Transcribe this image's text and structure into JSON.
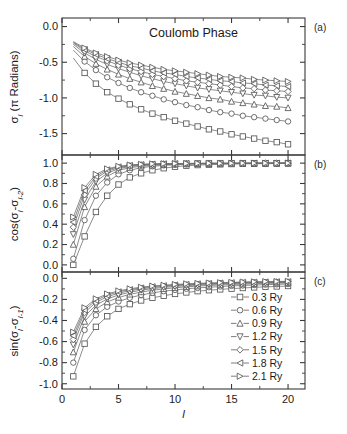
{
  "figure": {
    "annotation": "Coulomb Phase",
    "xlabel": "l",
    "panel_labels": [
      "(a)",
      "(b)",
      "(c)"
    ]
  },
  "legend": {
    "entries": [
      {
        "label": "0.3 Ry",
        "marker": "square"
      },
      {
        "label": "0.6 Ry",
        "marker": "circle"
      },
      {
        "label": "0.9 Ry",
        "marker": "triangle-up"
      },
      {
        "label": "1.2 Ry",
        "marker": "triangle-down"
      },
      {
        "label": "1.5 Ry",
        "marker": "diamond"
      },
      {
        "label": "1.8 Ry",
        "marker": "triangle-left"
      },
      {
        "label": "2.1 Ry",
        "marker": "triangle-right"
      }
    ]
  },
  "chart_data": [
    {
      "type": "line",
      "panel": "(a)",
      "title": "Coulomb Phase",
      "xlabel": "l",
      "ylabel": "σ_l (π Radians)",
      "ylabel_parts": {
        "sym": "σ",
        "sub": "l",
        "unit": "( π Radians)"
      },
      "xlim": [
        0,
        21.5
      ],
      "ylim": [
        -1.8,
        0.12
      ],
      "xticks": [
        0,
        5,
        10,
        15,
        20
      ],
      "yticks": [
        0.0,
        -0.5,
        -1.0,
        -1.5
      ],
      "ytick_labels": [
        "0.0",
        "-0.5",
        "-1.0",
        "-1.5"
      ],
      "grid": false,
      "legend_position": "none",
      "x": [
        1,
        2,
        3,
        4,
        5,
        6,
        7,
        8,
        9,
        10,
        11,
        12,
        13,
        14,
        15,
        16,
        17,
        18,
        19,
        20
      ],
      "series": [
        {
          "name": "0.3 Ry",
          "marker": "square",
          "values": [
            -0.44,
            -0.65,
            -0.8,
            -0.92,
            -1.01,
            -1.09,
            -1.16,
            -1.22,
            -1.27,
            -1.32,
            -1.36,
            -1.4,
            -1.44,
            -1.47,
            -1.51,
            -1.54,
            -1.57,
            -1.6,
            -1.62,
            -1.65
          ]
        },
        {
          "name": "0.6 Ry",
          "marker": "circle",
          "values": [
            -0.33,
            -0.49,
            -0.61,
            -0.71,
            -0.79,
            -0.86,
            -0.92,
            -0.97,
            -1.02,
            -1.06,
            -1.1,
            -1.13,
            -1.17,
            -1.2,
            -1.22,
            -1.25,
            -1.27,
            -1.29,
            -1.31,
            -1.33
          ]
        },
        {
          "name": "0.9 Ry",
          "marker": "triangle-up",
          "values": [
            -0.28,
            -0.42,
            -0.52,
            -0.6,
            -0.67,
            -0.73,
            -0.78,
            -0.83,
            -0.87,
            -0.91,
            -0.94,
            -0.97,
            -1.0,
            -1.02,
            -1.05,
            -1.07,
            -1.09,
            -1.11,
            -1.12,
            -1.14
          ]
        },
        {
          "name": "1.2 Ry",
          "marker": "triangle-down",
          "values": [
            -0.25,
            -0.37,
            -0.46,
            -0.53,
            -0.59,
            -0.64,
            -0.69,
            -0.73,
            -0.77,
            -0.8,
            -0.83,
            -0.86,
            -0.88,
            -0.9,
            -0.92,
            -0.94,
            -0.96,
            -0.97,
            -0.99,
            -1.0
          ]
        },
        {
          "name": "1.5 Ry",
          "marker": "diamond",
          "values": [
            -0.23,
            -0.34,
            -0.42,
            -0.48,
            -0.54,
            -0.59,
            -0.63,
            -0.67,
            -0.7,
            -0.73,
            -0.76,
            -0.78,
            -0.8,
            -0.82,
            -0.84,
            -0.86,
            -0.87,
            -0.89,
            -0.9,
            -0.91
          ]
        },
        {
          "name": "1.8 Ry",
          "marker": "triangle-left",
          "values": [
            -0.22,
            -0.32,
            -0.39,
            -0.45,
            -0.5,
            -0.55,
            -0.58,
            -0.62,
            -0.65,
            -0.67,
            -0.7,
            -0.72,
            -0.74,
            -0.76,
            -0.77,
            -0.79,
            -0.8,
            -0.82,
            -0.83,
            -0.84
          ]
        },
        {
          "name": "2.1 Ry",
          "marker": "triangle-right",
          "values": [
            -0.21,
            -0.3,
            -0.37,
            -0.42,
            -0.47,
            -0.51,
            -0.54,
            -0.57,
            -0.6,
            -0.62,
            -0.64,
            -0.66,
            -0.68,
            -0.7,
            -0.71,
            -0.72,
            -0.74,
            -0.75,
            -0.76,
            -0.77
          ]
        }
      ]
    },
    {
      "type": "line",
      "panel": "(b)",
      "xlabel": "l",
      "ylabel": "cos(σ_l-σ_l-2)",
      "xlim": [
        0,
        21.5
      ],
      "ylim": [
        -0.07,
        1.08
      ],
      "xticks": [
        0,
        5,
        10,
        15,
        20
      ],
      "yticks": [
        1.0,
        0.8,
        0.6,
        0.4,
        0.2,
        0.0
      ],
      "ytick_labels": [
        "1.0",
        "0.8",
        "0.6",
        "0.4",
        "0.2",
        "0.0"
      ],
      "grid": false,
      "legend_position": "none",
      "x": [
        1,
        2,
        3,
        4,
        5,
        6,
        7,
        8,
        9,
        10,
        11,
        12,
        13,
        14,
        15,
        16,
        17,
        18,
        19,
        20
      ],
      "series": [
        {
          "name": "0.3 Ry",
          "marker": "square",
          "values": [
            0.0,
            0.28,
            0.52,
            0.68,
            0.79,
            0.86,
            0.9,
            0.93,
            0.95,
            0.965,
            0.975,
            0.981,
            0.985,
            0.988,
            0.991,
            0.993,
            0.994,
            0.995,
            0.996,
            0.997
          ]
        },
        {
          "name": "0.6 Ry",
          "marker": "circle",
          "values": [
            0.06,
            0.44,
            0.68,
            0.81,
            0.89,
            0.93,
            0.955,
            0.969,
            0.978,
            0.984,
            0.988,
            0.991,
            0.993,
            0.995,
            0.996,
            0.997,
            0.997,
            0.998,
            0.998,
            0.999
          ]
        },
        {
          "name": "0.9 Ry",
          "marker": "triangle-up",
          "values": [
            0.2,
            0.57,
            0.77,
            0.87,
            0.93,
            0.955,
            0.97,
            0.979,
            0.985,
            0.989,
            0.992,
            0.994,
            0.995,
            0.996,
            0.997,
            0.998,
            0.998,
            0.999,
            0.999,
            0.999
          ]
        },
        {
          "name": "1.2 Ry",
          "marker": "triangle-down",
          "values": [
            0.3,
            0.64,
            0.82,
            0.9,
            0.945,
            0.967,
            0.978,
            0.985,
            0.989,
            0.992,
            0.994,
            0.996,
            0.997,
            0.997,
            0.998,
            0.998,
            0.999,
            0.999,
            0.999,
            1.0
          ]
        },
        {
          "name": "1.5 Ry",
          "marker": "diamond",
          "values": [
            0.37,
            0.69,
            0.85,
            0.92,
            0.955,
            0.974,
            0.983,
            0.988,
            0.992,
            0.994,
            0.996,
            0.997,
            0.998,
            0.998,
            0.999,
            0.999,
            0.999,
            1.0,
            1.0,
            1.0
          ]
        },
        {
          "name": "1.8 Ry",
          "marker": "triangle-left",
          "values": [
            0.42,
            0.73,
            0.87,
            0.934,
            0.963,
            0.978,
            0.986,
            0.991,
            0.994,
            0.995,
            0.997,
            0.997,
            0.998,
            0.999,
            0.999,
            0.999,
            1.0,
            1.0,
            1.0,
            1.0
          ]
        },
        {
          "name": "2.1 Ry",
          "marker": "triangle-right",
          "values": [
            0.47,
            0.76,
            0.89,
            0.944,
            0.969,
            0.982,
            0.989,
            0.993,
            0.995,
            0.996,
            0.997,
            0.998,
            0.999,
            0.999,
            0.999,
            1.0,
            1.0,
            1.0,
            1.0,
            1.0
          ]
        }
      ]
    },
    {
      "type": "line",
      "panel": "(c)",
      "xlabel": "l",
      "ylabel": "sin(σ_l-σ_l-1)",
      "xlim": [
        0,
        21.5
      ],
      "ylim": [
        -1.05,
        0.06
      ],
      "xticks": [
        0,
        5,
        10,
        15,
        20
      ],
      "yticks": [
        0.0,
        -0.2,
        -0.4,
        -0.6,
        -0.8,
        -1.0
      ],
      "ytick_labels": [
        "0.0",
        "-0.2",
        "-0.4",
        "-0.6",
        "-0.8",
        "-1.0"
      ],
      "grid": false,
      "legend_position": "bottom-right",
      "x": [
        1,
        2,
        3,
        4,
        5,
        6,
        7,
        8,
        9,
        10,
        11,
        12,
        13,
        14,
        15,
        16,
        17,
        18,
        19,
        20
      ],
      "series": [
        {
          "name": "0.3 Ry",
          "marker": "square",
          "values": [
            -0.93,
            -0.62,
            -0.46,
            -0.36,
            -0.29,
            -0.245,
            -0.21,
            -0.185,
            -0.165,
            -0.148,
            -0.134,
            -0.122,
            -0.113,
            -0.105,
            -0.098,
            -0.092,
            -0.086,
            -0.081,
            -0.077,
            -0.073
          ]
        },
        {
          "name": "0.6 Ry",
          "marker": "circle",
          "values": [
            -0.8,
            -0.49,
            -0.35,
            -0.27,
            -0.22,
            -0.185,
            -0.158,
            -0.138,
            -0.122,
            -0.11,
            -0.099,
            -0.091,
            -0.084,
            -0.078,
            -0.072,
            -0.068,
            -0.064,
            -0.06,
            -0.057,
            -0.054
          ]
        },
        {
          "name": "0.9 Ry",
          "marker": "triangle-up",
          "values": [
            -0.7,
            -0.41,
            -0.29,
            -0.225,
            -0.182,
            -0.152,
            -0.13,
            -0.114,
            -0.1,
            -0.09,
            -0.081,
            -0.074,
            -0.068,
            -0.063,
            -0.059,
            -0.055,
            -0.052,
            -0.049,
            -0.046,
            -0.044
          ]
        },
        {
          "name": "1.2 Ry",
          "marker": "triangle-down",
          "values": [
            -0.63,
            -0.36,
            -0.255,
            -0.196,
            -0.158,
            -0.132,
            -0.112,
            -0.098,
            -0.086,
            -0.077,
            -0.07,
            -0.064,
            -0.059,
            -0.054,
            -0.05,
            -0.047,
            -0.045,
            -0.042,
            -0.04,
            -0.038
          ]
        },
        {
          "name": "1.5 Ry",
          "marker": "diamond",
          "values": [
            -0.58,
            -0.325,
            -0.228,
            -0.175,
            -0.141,
            -0.117,
            -0.1,
            -0.087,
            -0.077,
            -0.069,
            -0.062,
            -0.057,
            -0.052,
            -0.048,
            -0.045,
            -0.042,
            -0.04,
            -0.037,
            -0.035,
            -0.034
          ]
        },
        {
          "name": "1.8 Ry",
          "marker": "triangle-left",
          "values": [
            -0.545,
            -0.3,
            -0.209,
            -0.16,
            -0.128,
            -0.107,
            -0.091,
            -0.079,
            -0.07,
            -0.063,
            -0.057,
            -0.052,
            -0.048,
            -0.044,
            -0.041,
            -0.038,
            -0.036,
            -0.034,
            -0.032,
            -0.031
          ]
        },
        {
          "name": "2.1 Ry",
          "marker": "triangle-right",
          "values": [
            -0.51,
            -0.279,
            -0.194,
            -0.148,
            -0.119,
            -0.099,
            -0.084,
            -0.073,
            -0.065,
            -0.058,
            -0.052,
            -0.048,
            -0.044,
            -0.041,
            -0.038,
            -0.035,
            -0.033,
            -0.031,
            -0.03,
            -0.028
          ]
        }
      ]
    }
  ]
}
